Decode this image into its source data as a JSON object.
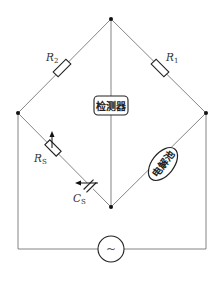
{
  "diagram": {
    "type": "wheatstone-bridge-conductivity-circuit",
    "nodes": {
      "top": [
        111,
        19
      ],
      "left": [
        18,
        113
      ],
      "right": [
        206,
        113
      ],
      "bottom": [
        111,
        207
      ]
    },
    "components": {
      "r2": {
        "label": "R",
        "subscript": "2"
      },
      "r1": {
        "label": "R",
        "subscript": "1"
      },
      "rs": {
        "label": "R",
        "subscript": "S"
      },
      "cs": {
        "label": "C",
        "subscript": "S"
      },
      "detector": {
        "label": "检测器"
      },
      "cell": {
        "label": "电解池"
      },
      "source": {
        "symbol": "~"
      }
    },
    "colors": {
      "wire": "#777777",
      "component": "#222222",
      "background": "#ffffff"
    }
  }
}
